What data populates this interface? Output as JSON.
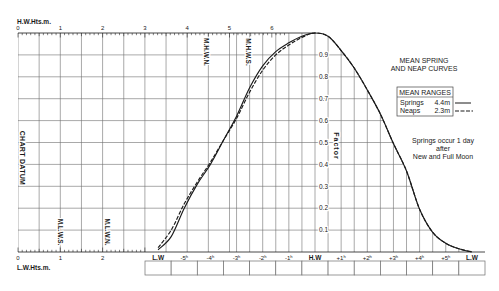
{
  "chart_data": {
    "type": "line",
    "title_lines": [
      "MEAN SPRING",
      "AND NEAP CURVES"
    ],
    "xlabel": "",
    "ylabel": "Factor",
    "x_ticks_hours": [
      -6,
      -5,
      -4,
      -3,
      -2,
      -1,
      0,
      1,
      2,
      3,
      4,
      5,
      6
    ],
    "x_tick_labels": [
      "L.W",
      "-5ʰ",
      "-4ʰ",
      "-3ʰ",
      "-2ʰ",
      "-1ʰ",
      "H.W",
      "+1ʰ",
      "+2ʰ",
      "+3ʰ",
      "+4ʰ",
      "+5ʰ",
      "L.W"
    ],
    "x": [
      -6,
      -5.5,
      -5,
      -4.5,
      -4,
      -3.5,
      -3,
      -2.5,
      -2,
      -1.5,
      -1,
      -0.5,
      0,
      0.5,
      1,
      1.5,
      2,
      2.5,
      3,
      3.5,
      4,
      4.5,
      5,
      5.5,
      6
    ],
    "series": [
      {
        "name": "Springs",
        "range": "4.4m",
        "style": "solid",
        "values": [
          0.01,
          0.07,
          0.2,
          0.31,
          0.4,
          0.51,
          0.62,
          0.75,
          0.85,
          0.915,
          0.955,
          0.985,
          1.0,
          0.985,
          0.92,
          0.84,
          0.74,
          0.63,
          0.495,
          0.37,
          0.195,
          0.09,
          0.04,
          0.015,
          0.0
        ]
      },
      {
        "name": "Neaps",
        "range": "2.3m",
        "style": "dashed",
        "values": [
          0.02,
          0.1,
          0.22,
          0.32,
          0.41,
          0.51,
          0.61,
          0.73,
          0.83,
          0.9,
          0.945,
          0.98,
          1.0,
          0.985,
          0.92,
          0.84,
          0.74,
          0.63,
          0.495,
          0.37,
          0.195,
          0.09,
          0.04,
          0.015,
          0.0
        ]
      }
    ],
    "y_ticks": [
      0.1,
      0.2,
      0.3,
      0.4,
      0.5,
      0.6,
      0.7,
      0.8,
      0.9
    ],
    "y_tick_labels": [
      "0.1",
      "0.2",
      "0.3",
      "0.4",
      "0.5",
      "0.6",
      "0.7",
      "0.8",
      "0.9"
    ],
    "xlim": [
      -6,
      6
    ],
    "ylim": [
      0,
      1
    ],
    "grid": true,
    "legend": {
      "title": "MEAN RANGES",
      "position": "right",
      "entries": [
        {
          "name": "Springs",
          "value": "4.4m",
          "style": "solid"
        },
        {
          "name": "Neaps",
          "value": "2.3m",
          "style": "dashed"
        }
      ]
    },
    "annotations": {
      "springs_note_lines": [
        "Springs occur 1 day",
        "after",
        "New and Full Moon"
      ],
      "datum": "CHART DATUM"
    },
    "height_scales": {
      "hw": {
        "label": "H.W.Hts.m.",
        "ticks": [
          "0",
          "1",
          "2",
          "3",
          "4",
          "5",
          "6"
        ]
      },
      "lw": {
        "label": "L.W.Hts.m.",
        "ticks": [
          "0",
          "1",
          "2"
        ]
      }
    },
    "reference_levels": [
      {
        "label": "M.L.W.S.",
        "height_m": 1.0
      },
      {
        "label": "M.L.W.N.",
        "height_m": 2.1
      },
      {
        "label": "M.H.W.N.",
        "height_m": 4.45
      },
      {
        "label": "M.H.W.S.",
        "height_m": 5.45
      }
    ],
    "time_entry_boxes": [
      "",
      "",
      "",
      "",
      "",
      "",
      "",
      "",
      "",
      "",
      "",
      "",
      ""
    ]
  },
  "colors": {
    "ink": "#1a1a1a",
    "grid": "#6e6e6e",
    "background": "#ffffff"
  }
}
